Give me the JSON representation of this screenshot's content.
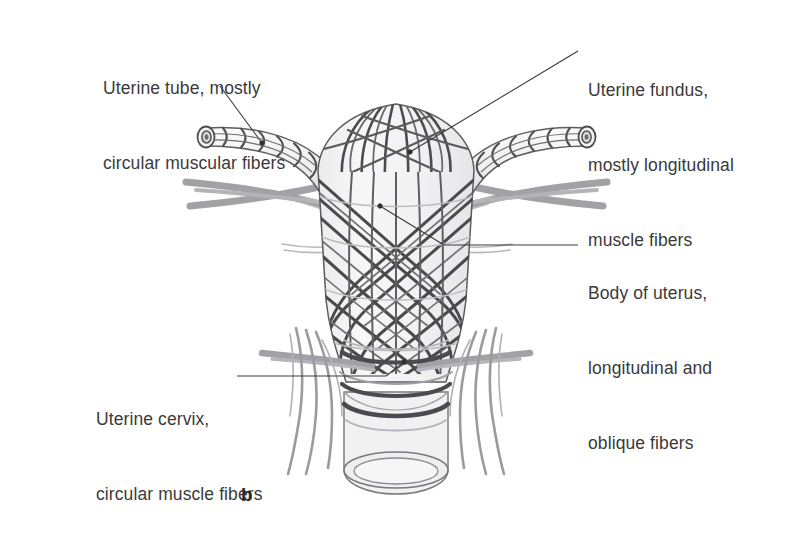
{
  "figure": {
    "panel_letter": "b",
    "background_color": "#ffffff",
    "text_color": "#3a3a3a",
    "fiber_color_dark": "#4a4a4f",
    "fiber_color_mid": "#6e6e73",
    "ligament_color": "#9a9a9e",
    "organ_fill": "#f4f4f4",
    "outline_color": "#5c5c60"
  },
  "labels": {
    "uterine_tube": {
      "lines": [
        "Uterine tube, mostly",
        "circular muscular fibers"
      ],
      "leader_dot": {
        "x": 262,
        "y": 143
      }
    },
    "uterine_fundus": {
      "lines": [
        "Uterine fundus,",
        "mostly longitudinal",
        "muscle fibers"
      ],
      "leader_dot": {
        "x": 410,
        "y": 152
      }
    },
    "body_of_uterus": {
      "lines": [
        "Body of uterus,",
        "longitudinal and",
        "oblique fibers"
      ],
      "leader_dot": {
        "x": 380,
        "y": 206
      }
    },
    "uterine_cervix": {
      "lines": [
        "Uterine cervix,",
        "circular muscle fibers"
      ],
      "leader_dot": {
        "x": 404,
        "y": 362
      }
    }
  },
  "structures": [
    {
      "name": "uterine-tube-left",
      "side": "left"
    },
    {
      "name": "uterine-tube-right",
      "side": "right"
    },
    {
      "name": "uterine-fundus",
      "side": "center"
    },
    {
      "name": "uterine-body",
      "side": "center"
    },
    {
      "name": "uterine-cervix",
      "side": "center"
    },
    {
      "name": "vaginal-cuff",
      "side": "center"
    },
    {
      "name": "broad-ligament-upper",
      "side": "both"
    },
    {
      "name": "broad-ligament-lower",
      "side": "both"
    }
  ]
}
